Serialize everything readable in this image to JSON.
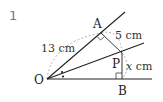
{
  "problem": {
    "number": "1"
  },
  "figure": {
    "points": {
      "O": {
        "label": "O",
        "x": 47,
        "y": 79
      },
      "A": {
        "label": "A",
        "x": 101,
        "y": 33
      },
      "P": {
        "label": "P",
        "x": 122,
        "y": 53
      },
      "B": {
        "label": "B",
        "x": 122,
        "y": 79
      }
    },
    "measurements": {
      "OA": "13 cm",
      "AP": "5 cm",
      "PB_prefix": "x",
      "PB_unit": " cm"
    },
    "colors": {
      "line": "#222222",
      "dashed": "#9a9a9a",
      "number": "#7a7a7a"
    }
  }
}
